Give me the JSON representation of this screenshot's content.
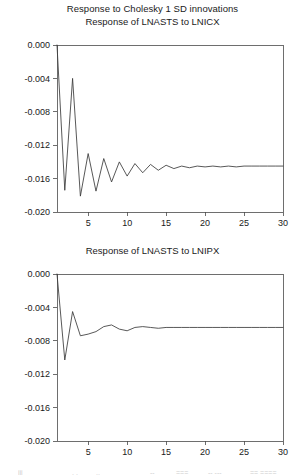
{
  "figure": {
    "main_title": "Response to Cholesky 1 SD innovations",
    "background_color": "#ffffff",
    "line_color": "#3a3a3a",
    "axis_color": "#4a4a4a"
  },
  "chart_data": [
    {
      "type": "line",
      "title": "Response of LNASTS to LNICX",
      "xlabel": "",
      "ylabel": "",
      "xlim": [
        1,
        30
      ],
      "ylim": [
        -0.02,
        0.0
      ],
      "grid": false,
      "legend": null,
      "xticks": [
        5,
        10,
        15,
        20,
        25,
        30
      ],
      "yticks": [
        0.0,
        -0.004,
        -0.008,
        -0.012,
        -0.016,
        -0.02
      ],
      "ytick_labels": [
        "0.000",
        "-0.004",
        "-0.008",
        "-0.012",
        "-0.016",
        "-0.020"
      ],
      "xtick_labels": [
        "5",
        "10",
        "15",
        "20",
        "25",
        "30"
      ],
      "x": [
        1,
        2,
        3,
        4,
        5,
        6,
        7,
        8,
        9,
        10,
        11,
        12,
        13,
        14,
        15,
        16,
        17,
        18,
        19,
        20,
        21,
        22,
        23,
        24,
        25,
        26,
        27,
        28,
        29,
        30
      ],
      "values": [
        0.0,
        -0.0174,
        -0.004,
        -0.0181,
        -0.013,
        -0.0175,
        -0.0136,
        -0.0164,
        -0.014,
        -0.0157,
        -0.0142,
        -0.0153,
        -0.0143,
        -0.015,
        -0.0144,
        -0.0148,
        -0.0145,
        -0.0147,
        -0.0145,
        -0.0146,
        -0.0145,
        -0.0146,
        -0.0145,
        -0.0146,
        -0.0145,
        -0.0145,
        -0.0145,
        -0.0145,
        -0.0145,
        -0.0145
      ],
      "converges_to": -0.0145
    },
    {
      "type": "line",
      "title": "Response of LNASTS to LNIPX",
      "xlabel": "",
      "ylabel": "",
      "xlim": [
        1,
        30
      ],
      "ylim": [
        -0.02,
        0.0
      ],
      "grid": false,
      "legend": null,
      "xticks": [
        5,
        10,
        15,
        20,
        25,
        30
      ],
      "yticks": [
        0.0,
        -0.004,
        -0.008,
        -0.012,
        -0.016,
        -0.02
      ],
      "ytick_labels": [
        "0.000",
        "-0.004",
        "-0.008",
        "-0.012",
        "-0.016",
        "-0.020"
      ],
      "xtick_labels": [
        "5",
        "10",
        "15",
        "20",
        "25",
        "30"
      ],
      "x": [
        1,
        2,
        3,
        4,
        5,
        6,
        7,
        8,
        9,
        10,
        11,
        12,
        13,
        14,
        15,
        16,
        17,
        18,
        19,
        20,
        21,
        22,
        23,
        24,
        25,
        26,
        27,
        28,
        29,
        30
      ],
      "values": [
        0.0,
        -0.0103,
        -0.0045,
        -0.0074,
        -0.0072,
        -0.0069,
        -0.0063,
        -0.0061,
        -0.0066,
        -0.0068,
        -0.0064,
        -0.0063,
        -0.0064,
        -0.0065,
        -0.0064,
        -0.0064,
        -0.0064,
        -0.0064,
        -0.0064,
        -0.0064,
        -0.0064,
        -0.0064,
        -0.0064,
        -0.0064,
        -0.0064,
        -0.0064,
        -0.0064,
        -0.0064,
        -0.0064,
        -0.0064
      ],
      "converges_to": -0.0064
    }
  ]
}
